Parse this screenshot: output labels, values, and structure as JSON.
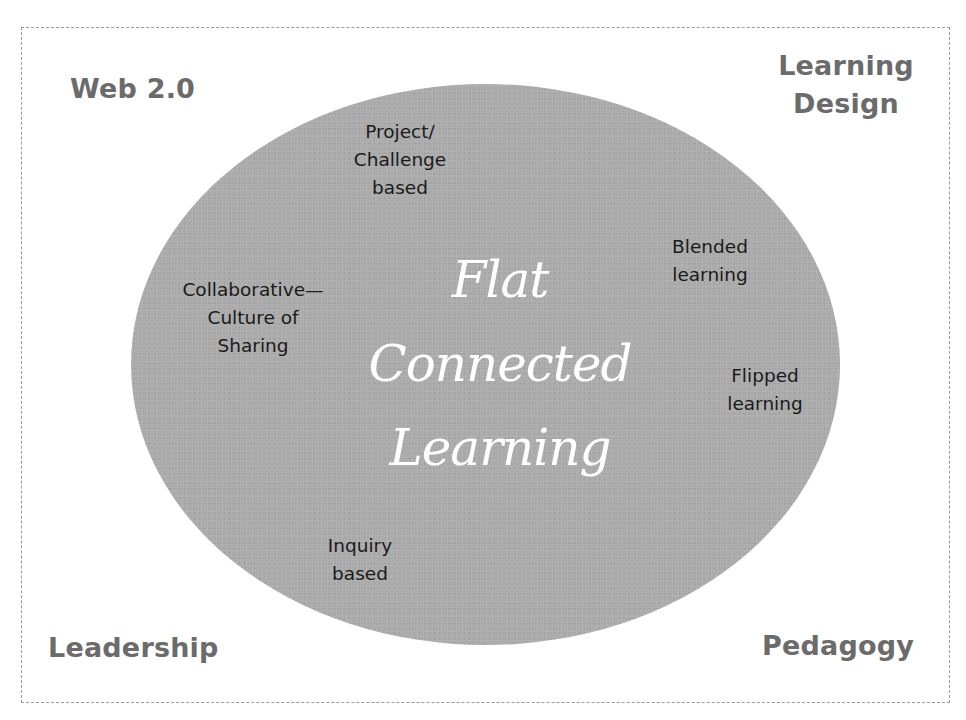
{
  "diagram": {
    "title_lines": [
      "Flat",
      "Connected",
      "Learning"
    ],
    "corners": {
      "top_left": "Web 2.0",
      "top_right_lines": [
        "Learning",
        "Design"
      ],
      "bottom_left": "Leadership",
      "bottom_right": "Pedagogy"
    },
    "topics": [
      {
        "lines": [
          "Project/",
          "Challenge",
          "based"
        ]
      },
      {
        "lines": [
          "Collaborative—",
          "Culture of",
          "Sharing"
        ]
      },
      {
        "lines": [
          "Blended",
          "learning"
        ]
      },
      {
        "lines": [
          "Flipped",
          "learning"
        ]
      },
      {
        "lines": [
          "Inquiry",
          "based"
        ]
      }
    ],
    "colors": {
      "ellipse_fill": "#aaaaaa",
      "corner_text": "#6b6b6b",
      "topic_text": "#1a1a1a",
      "title_text": "#ffffff",
      "frame_border": "#9a9a9a"
    }
  }
}
